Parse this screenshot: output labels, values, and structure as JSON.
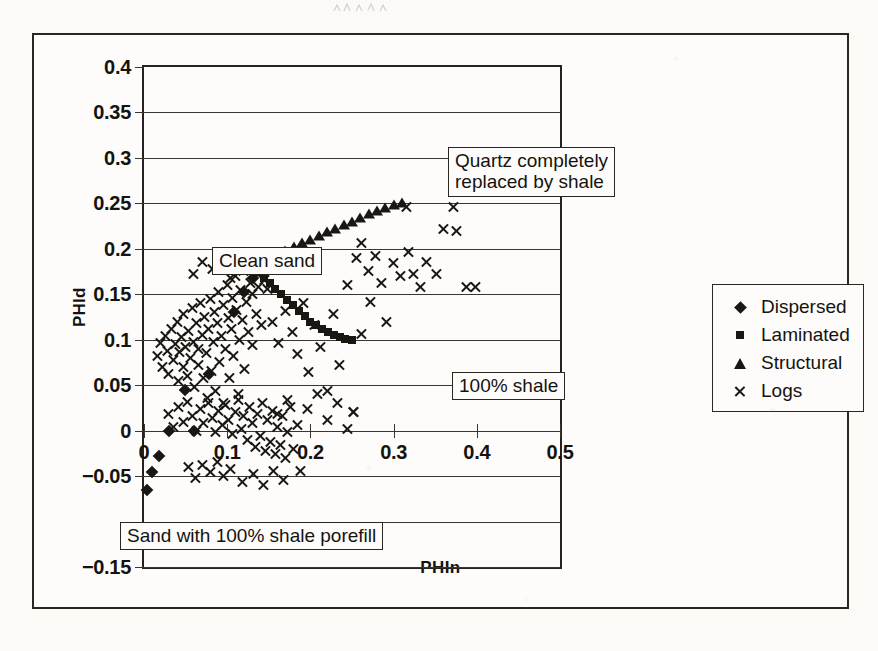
{
  "figure": {
    "outer_border": true
  },
  "axis": {
    "ylabel": "PHId",
    "xlabel": "PHIn"
  },
  "legend": {
    "items": [
      {
        "label": "Dispersed",
        "marker": "diamond-icon"
      },
      {
        "label": "Laminated",
        "marker": "square-icon"
      },
      {
        "label": "Structural",
        "marker": "triangle-icon"
      },
      {
        "label": "Logs",
        "marker": "cross-icon"
      }
    ]
  },
  "annotations": [
    {
      "id": "quartz",
      "text": "Quartz completely\nreplaced by shale"
    },
    {
      "id": "clean",
      "text": "Clean sand"
    },
    {
      "id": "shale100",
      "text": "100% shale"
    },
    {
      "id": "porefill",
      "text": "Sand with 100% shale porefill"
    }
  ],
  "chart_data": {
    "type": "scatter",
    "title": "",
    "xlabel": "PHIn",
    "ylabel": "PHId",
    "xlim": [
      0,
      0.5
    ],
    "ylim": [
      -0.15,
      0.4
    ],
    "xticks": [
      0,
      0.1,
      0.2,
      0.3,
      0.4,
      0.5
    ],
    "xtick_labels": [
      "0",
      "0.1",
      "0.2",
      "0.3",
      "0.4",
      "0.5"
    ],
    "yticks": [
      -0.15,
      -0.1,
      -0.05,
      0,
      0.05,
      0.1,
      0.15,
      0.2,
      0.25,
      0.3,
      0.35,
      0.4
    ],
    "ytick_labels": [
      "-0.15",
      "-0.1",
      "-0.05",
      "0",
      "0.05",
      "0.1",
      "0.15",
      "0.2",
      "0.25",
      "0.3",
      "0.35",
      "0.4"
    ],
    "ytick_labels_hidden": [
      "-0.1"
    ],
    "grid": "horizontal",
    "legend_position": "right-outside",
    "series": [
      {
        "name": "Dispersed",
        "marker": "diamond",
        "points": [
          [
            0.004,
            -0.065
          ],
          [
            0.01,
            -0.045
          ],
          [
            0.018,
            -0.028
          ],
          [
            0.03,
            0.0
          ],
          [
            0.06,
            0.0
          ],
          [
            0.049,
            0.045
          ],
          [
            0.078,
            0.062
          ],
          [
            0.108,
            0.13
          ],
          [
            0.12,
            0.152
          ],
          [
            0.131,
            0.168
          ],
          [
            0.178,
            0.18
          ]
        ]
      },
      {
        "name": "Laminated",
        "marker": "square",
        "points": [
          [
            0.13,
            0.18
          ],
          [
            0.137,
            0.174
          ],
          [
            0.144,
            0.168
          ],
          [
            0.151,
            0.162
          ],
          [
            0.158,
            0.156
          ],
          [
            0.165,
            0.15
          ],
          [
            0.172,
            0.144
          ],
          [
            0.179,
            0.138
          ],
          [
            0.186,
            0.132
          ],
          [
            0.193,
            0.126
          ],
          [
            0.2,
            0.12
          ],
          [
            0.207,
            0.116
          ],
          [
            0.214,
            0.112
          ],
          [
            0.221,
            0.108
          ],
          [
            0.228,
            0.105
          ],
          [
            0.235,
            0.103
          ],
          [
            0.242,
            0.101
          ],
          [
            0.25,
            0.1
          ]
        ]
      },
      {
        "name": "Structural",
        "marker": "triangle",
        "points": [
          [
            0.13,
            0.18
          ],
          [
            0.14,
            0.185
          ],
          [
            0.15,
            0.19
          ],
          [
            0.16,
            0.194
          ],
          [
            0.17,
            0.198
          ],
          [
            0.18,
            0.202
          ],
          [
            0.19,
            0.206
          ],
          [
            0.2,
            0.21
          ],
          [
            0.21,
            0.214
          ],
          [
            0.22,
            0.218
          ],
          [
            0.23,
            0.222
          ],
          [
            0.24,
            0.226
          ],
          [
            0.25,
            0.23
          ],
          [
            0.26,
            0.234
          ],
          [
            0.27,
            0.238
          ],
          [
            0.28,
            0.242
          ],
          [
            0.29,
            0.245
          ],
          [
            0.3,
            0.248
          ],
          [
            0.31,
            0.25
          ]
        ]
      },
      {
        "name": "Logs",
        "marker": "cross",
        "points": [
          [
            0.016,
            0.082
          ],
          [
            0.02,
            0.096
          ],
          [
            0.022,
            0.07
          ],
          [
            0.026,
            0.104
          ],
          [
            0.028,
            0.088
          ],
          [
            0.03,
            0.062
          ],
          [
            0.033,
            0.112
          ],
          [
            0.035,
            0.078
          ],
          [
            0.038,
            0.095
          ],
          [
            0.04,
            0.12
          ],
          [
            0.041,
            0.055
          ],
          [
            0.043,
            0.086
          ],
          [
            0.045,
            0.103
          ],
          [
            0.047,
            0.07
          ],
          [
            0.048,
            0.128
          ],
          [
            0.05,
            0.092
          ],
          [
            0.052,
            0.06
          ],
          [
            0.054,
            0.11
          ],
          [
            0.056,
            0.08
          ],
          [
            0.058,
            0.135
          ],
          [
            0.06,
            0.098
          ],
          [
            0.061,
            0.048
          ],
          [
            0.063,
            0.118
          ],
          [
            0.065,
            0.072
          ],
          [
            0.066,
            0.09
          ],
          [
            0.068,
            0.14
          ],
          [
            0.07,
            0.105
          ],
          [
            0.071,
            0.058
          ],
          [
            0.073,
            0.125
          ],
          [
            0.075,
            0.085
          ],
          [
            0.076,
            0.036
          ],
          [
            0.078,
            0.112
          ],
          [
            0.08,
            0.145
          ],
          [
            0.081,
            0.066
          ],
          [
            0.083,
            0.098
          ],
          [
            0.085,
            0.13
          ],
          [
            0.086,
            0.044
          ],
          [
            0.088,
            0.118
          ],
          [
            0.09,
            0.152
          ],
          [
            0.091,
            0.076
          ],
          [
            0.093,
            0.104
          ],
          [
            0.095,
            0.138
          ],
          [
            0.096,
            0.03
          ],
          [
            0.098,
            0.09
          ],
          [
            0.1,
            0.16
          ],
          [
            0.101,
            0.124
          ],
          [
            0.103,
            0.058
          ],
          [
            0.105,
            0.112
          ],
          [
            0.106,
            0.146
          ],
          [
            0.108,
            0.082
          ],
          [
            0.11,
            0.17
          ],
          [
            0.111,
            0.133
          ],
          [
            0.113,
            0.04
          ],
          [
            0.115,
            0.1
          ],
          [
            0.116,
            0.155
          ],
          [
            0.118,
            0.122
          ],
          [
            0.12,
            0.176
          ],
          [
            0.121,
            0.068
          ],
          [
            0.123,
            0.142
          ],
          [
            0.125,
            0.108
          ],
          [
            0.126,
            0.182
          ],
          [
            0.128,
            0.162
          ],
          [
            0.13,
            0.094
          ],
          [
            0.131,
            0.15
          ],
          [
            0.133,
            0.186
          ],
          [
            0.135,
            0.128
          ],
          [
            0.136,
            0.172
          ],
          [
            0.138,
            0.158
          ],
          [
            0.14,
            0.19
          ],
          [
            0.141,
            0.116
          ],
          [
            0.143,
            0.178
          ],
          [
            0.145,
            0.166
          ],
          [
            0.146,
            0.184
          ],
          [
            0.148,
            0.156
          ],
          [
            0.03,
            0.018
          ],
          [
            0.036,
            0.004
          ],
          [
            0.042,
            0.026
          ],
          [
            0.048,
            0.01
          ],
          [
            0.052,
            0.032
          ],
          [
            0.058,
            0.016
          ],
          [
            0.063,
            0.0
          ],
          [
            0.068,
            0.024
          ],
          [
            0.072,
            0.008
          ],
          [
            0.077,
            0.03
          ],
          [
            0.082,
            0.014
          ],
          [
            0.086,
            -0.002
          ],
          [
            0.09,
            0.022
          ],
          [
            0.094,
            0.006
          ],
          [
            0.098,
            0.028
          ],
          [
            0.102,
            0.012
          ],
          [
            0.106,
            -0.004
          ],
          [
            0.11,
            0.02
          ],
          [
            0.113,
            0.034
          ],
          [
            0.117,
            0.002
          ],
          [
            0.12,
            0.016
          ],
          [
            0.124,
            -0.01
          ],
          [
            0.127,
            0.026
          ],
          [
            0.13,
            0.008
          ],
          [
            0.134,
            -0.018
          ],
          [
            0.137,
            0.018
          ],
          [
            0.14,
            -0.006
          ],
          [
            0.143,
            0.03
          ],
          [
            0.146,
            -0.022
          ],
          [
            0.149,
            0.012
          ],
          [
            0.152,
            -0.012
          ],
          [
            0.155,
            0.022
          ],
          [
            0.158,
            -0.026
          ],
          [
            0.161,
            0.004
          ],
          [
            0.164,
            -0.016
          ],
          [
            0.167,
            0.016
          ],
          [
            0.17,
            -0.03
          ],
          [
            0.173,
            -0.002
          ],
          [
            0.176,
            0.026
          ],
          [
            0.18,
            -0.02
          ],
          [
            0.054,
            -0.04
          ],
          [
            0.062,
            -0.052
          ],
          [
            0.07,
            -0.038
          ],
          [
            0.08,
            -0.046
          ],
          [
            0.088,
            -0.034
          ],
          [
            0.096,
            -0.05
          ],
          [
            0.104,
            -0.042
          ],
          [
            0.118,
            -0.056
          ],
          [
            0.132,
            -0.048
          ],
          [
            0.144,
            -0.06
          ],
          [
            0.156,
            -0.044
          ],
          [
            0.168,
            -0.054
          ],
          [
            0.06,
            0.172
          ],
          [
            0.07,
            0.186
          ],
          [
            0.082,
            0.178
          ],
          [
            0.094,
            0.192
          ],
          [
            0.104,
            0.168
          ],
          [
            0.112,
            0.196
          ],
          [
            0.122,
            0.188
          ],
          [
            0.155,
            0.12
          ],
          [
            0.162,
            0.096
          ],
          [
            0.17,
            0.132
          ],
          [
            0.178,
            0.108
          ],
          [
            0.185,
            0.084
          ],
          [
            0.192,
            0.14
          ],
          [
            0.198,
            0.064
          ],
          [
            0.205,
            0.116
          ],
          [
            0.212,
            0.092
          ],
          [
            0.22,
            0.044
          ],
          [
            0.228,
            0.128
          ],
          [
            0.235,
            0.072
          ],
          [
            0.16,
            0.018
          ],
          [
            0.172,
            0.034
          ],
          [
            0.184,
            0.006
          ],
          [
            0.196,
            0.024
          ],
          [
            0.208,
            0.04
          ],
          [
            0.22,
            0.012
          ],
          [
            0.232,
            0.03
          ],
          [
            0.244,
            0.002
          ],
          [
            0.252,
            0.02
          ],
          [
            0.188,
            -0.044
          ],
          [
            0.245,
            0.16
          ],
          [
            0.255,
            0.19
          ],
          [
            0.262,
            0.206
          ],
          [
            0.27,
            0.176
          ],
          [
            0.278,
            0.192
          ],
          [
            0.286,
            0.162
          ],
          [
            0.292,
            0.12
          ],
          [
            0.3,
            0.184
          ],
          [
            0.308,
            0.17
          ],
          [
            0.316,
            0.246
          ],
          [
            0.318,
            0.196
          ],
          [
            0.324,
            0.172
          ],
          [
            0.332,
            0.158
          ],
          [
            0.34,
            0.186
          ],
          [
            0.352,
            0.172
          ],
          [
            0.36,
            0.222
          ],
          [
            0.372,
            0.246
          ],
          [
            0.376,
            0.22
          ],
          [
            0.388,
            0.158
          ],
          [
            0.398,
            0.158
          ],
          [
            0.272,
            0.142
          ],
          [
            0.252,
            0.02
          ],
          [
            0.262,
            0.106
          ]
        ]
      }
    ]
  }
}
